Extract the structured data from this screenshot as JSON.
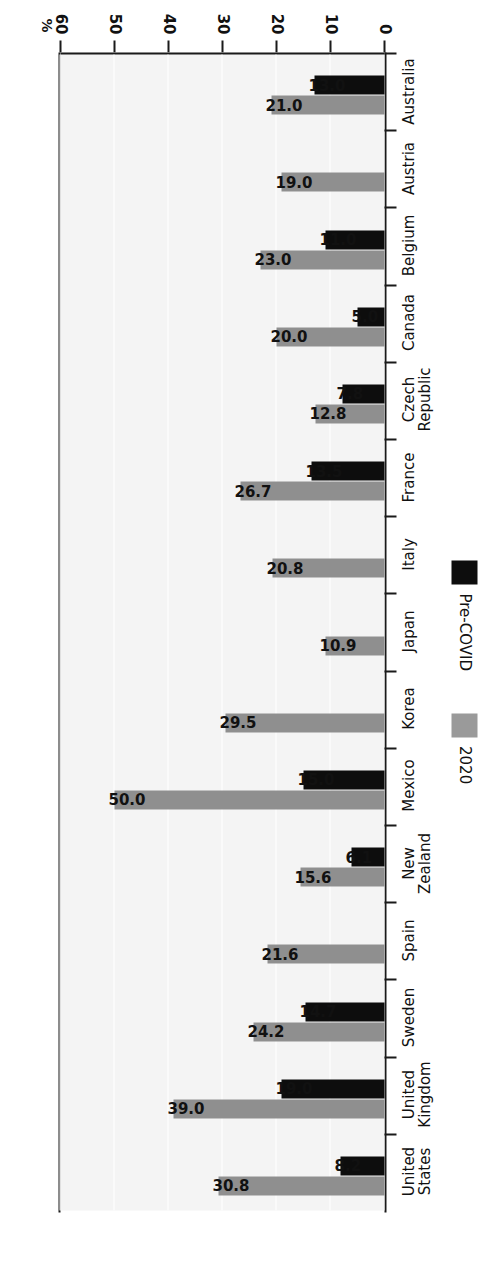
{
  "chart_data": {
    "type": "bar",
    "orientation": "horizontal",
    "title": "",
    "xlabel": "",
    "ylabel": "%",
    "axis_unit_label": "%",
    "ylim": [
      0,
      60
    ],
    "ticks": [
      0,
      10,
      20,
      30,
      40,
      50,
      60
    ],
    "grid": true,
    "legend_position": "left-middle",
    "categories": [
      "Australia",
      "Austria",
      "Belgium",
      "Canada",
      "Czech\nRepublic",
      "France",
      "Italy",
      "Japan",
      "Korea",
      "Mexico",
      "New\nZealand",
      "Spain",
      "Sweden",
      "United\nKingdom",
      "United\nStates"
    ],
    "series": [
      {
        "name": "Pre-COVID",
        "color": "#0d0d0d",
        "values": [
          13.0,
          null,
          11.0,
          5.0,
          7.8,
          13.5,
          null,
          null,
          null,
          15.0,
          6.1,
          null,
          14.7,
          19.0,
          8.2
        ],
        "labels": [
          "13.0",
          "",
          "11.0",
          "5.0",
          "7.8",
          "13.5",
          "",
          "",
          "",
          "15.0",
          "6.1",
          "",
          "14.7",
          "19.0",
          "8.2"
        ]
      },
      {
        "name": "2020",
        "color": "#8f8f8f",
        "values": [
          21.0,
          19.0,
          23.0,
          20.0,
          12.8,
          26.7,
          20.8,
          10.9,
          29.5,
          50.0,
          15.6,
          21.6,
          24.2,
          39.0,
          30.8
        ],
        "labels": [
          "21.0",
          "19.0",
          "23.0",
          "20.0",
          "12.8",
          "26.7",
          "20.8",
          "10.9",
          "29.5",
          "50.0",
          "15.6",
          "21.6",
          "24.2",
          "39.0",
          "30.8"
        ]
      }
    ]
  },
  "legend": {
    "items": [
      {
        "label": "Pre-COVID",
        "color": "#0d0d0d"
      },
      {
        "label": "2020",
        "color": "#9a9a9a"
      }
    ]
  },
  "axis": {
    "unit": "%",
    "tick_labels": [
      "0",
      "10",
      "20",
      "30",
      "40",
      "50",
      "60"
    ]
  }
}
